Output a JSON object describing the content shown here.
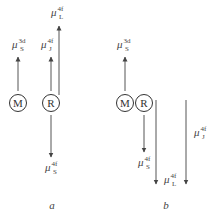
{
  "panels": [
    {
      "caption": "a",
      "atoms": [
        {
          "label": "M",
          "cx": 18,
          "cy": 103
        },
        {
          "label": "R",
          "cx": 51,
          "cy": 103
        }
      ],
      "arrows": [
        {
          "name": "mu-s-3d-up",
          "x": 18,
          "y1": 91,
          "y2": 57,
          "dir": "up",
          "symbol": "μ",
          "sup": "3d",
          "sub": "S",
          "lx": 12,
          "ly": 48
        },
        {
          "name": "mu-j-4f-up",
          "x": 51,
          "y1": 91,
          "y2": 57,
          "dir": "up",
          "symbol": "μ",
          "sup": "4f",
          "sub": "J",
          "lx": 41,
          "ly": 48
        },
        {
          "name": "mu-l-4f-up",
          "x": 59,
          "y1": 95,
          "y2": 26,
          "dir": "up",
          "symbol": "μ",
          "sup": "4f",
          "sub": "L",
          "lx": 51,
          "ly": 16
        },
        {
          "name": "mu-s-4f-down",
          "x": 51,
          "y1": 115,
          "y2": 157,
          "dir": "down",
          "symbol": "μ",
          "sup": "4f",
          "sub": "S",
          "lx": 45,
          "ly": 171
        }
      ]
    },
    {
      "caption": "b",
      "atoms": [
        {
          "label": "M",
          "cx": 125,
          "cy": 103
        },
        {
          "label": "R",
          "cx": 144,
          "cy": 103
        }
      ],
      "arrows": [
        {
          "name": "mu-s-3d-up",
          "x": 125,
          "y1": 91,
          "y2": 57,
          "dir": "up",
          "symbol": "μ",
          "sup": "3d",
          "sub": "S",
          "lx": 117,
          "ly": 48
        },
        {
          "name": "mu-s-4f-down",
          "x": 144,
          "y1": 115,
          "y2": 152,
          "dir": "down",
          "symbol": "μ",
          "sup": "4f",
          "sub": "S",
          "lx": 138,
          "ly": 166
        },
        {
          "name": "mu-l-4f-down",
          "x": 156,
          "y1": 100,
          "y2": 184,
          "dir": "down",
          "symbol": "μ",
          "sup": "4f",
          "sub": "L",
          "lx": 164,
          "ly": 183
        },
        {
          "name": "mu-j-4f-down",
          "x": 186,
          "y1": 100,
          "y2": 184,
          "dir": "down",
          "symbol": "μ",
          "sup": "4f",
          "sub": "J",
          "lx": 194,
          "ly": 136
        }
      ]
    }
  ],
  "captions": {
    "a": "a",
    "b": "b"
  },
  "colors": {
    "line": "#555555",
    "circle": "#333333"
  }
}
